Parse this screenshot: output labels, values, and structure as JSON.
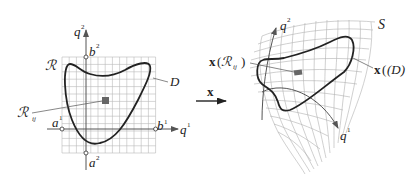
{
  "figure": {
    "left_panel": {
      "region_label": "ℛ",
      "domain_label": "D",
      "cell_label": "ℛ",
      "cell_subscript": "ij",
      "axis_h": {
        "name": "q",
        "sup": "1"
      },
      "axis_v": {
        "name": "q",
        "sup": "2"
      },
      "a1": {
        "name": "a",
        "sup": "1"
      },
      "b1": {
        "name": "b",
        "sup": "1"
      },
      "a2": {
        "name": "a",
        "sup": "2"
      },
      "b2": {
        "name": "b",
        "sup": "2"
      }
    },
    "mapping": {
      "label": "x"
    },
    "right_panel": {
      "surface_label": "S",
      "image_domain_label_prefix": "x",
      "image_domain_label_arg": "(D)",
      "image_cell_prefix": "x",
      "image_cell_open": "(",
      "image_cell_R": "ℛ",
      "image_cell_sub": "ij",
      "image_cell_close": ")",
      "axis1": {
        "name": "q",
        "sup": "1"
      },
      "axis2": {
        "name": "q",
        "sup": "2"
      }
    },
    "colors": {
      "curve": "#222222",
      "grid": "#b8b8b8",
      "cell": "#666666",
      "axis": "#555555"
    }
  }
}
